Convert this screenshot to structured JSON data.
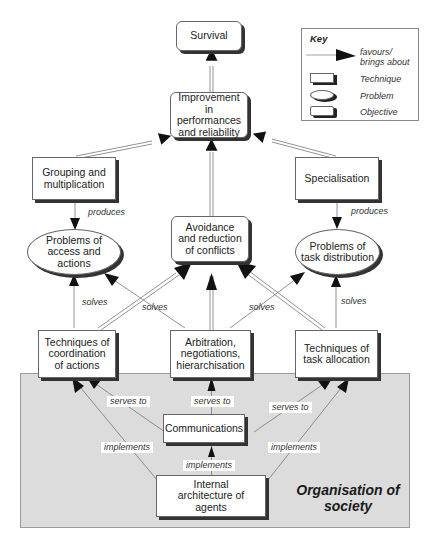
{
  "key": {
    "title": "Key",
    "items": [
      {
        "symbol": "arrow",
        "label": "favours/ brings about"
      },
      {
        "symbol": "rectangle",
        "label": "Technique"
      },
      {
        "symbol": "ellipse",
        "label": "Problem"
      },
      {
        "symbol": "rounded-rectangle",
        "label": "Objective"
      }
    ]
  },
  "nodes": {
    "survival": {
      "label": "Survival",
      "type": "Objective"
    },
    "improvement": {
      "label": "Improvement in performances and reliability",
      "type": "Objective"
    },
    "grouping": {
      "label": "Grouping and multiplication",
      "type": "Technique"
    },
    "specialisation": {
      "label": "Specialisation",
      "type": "Technique"
    },
    "avoidance": {
      "label": "Avoidance and reduction of conflicts",
      "type": "Objective"
    },
    "problems_access": {
      "label": "Problems of access and actions",
      "type": "Problem"
    },
    "problems_task": {
      "label": "Problems of task distribution",
      "type": "Problem"
    },
    "coordination": {
      "label": "Techniques of coordination of actions",
      "type": "Technique"
    },
    "arbitration": {
      "label": "Arbitration, negotiations, hierarchisation",
      "type": "Technique"
    },
    "task_allocation": {
      "label": "Techniques of task allocation",
      "type": "Technique"
    },
    "communications": {
      "label": "Communications",
      "type": "Technique"
    },
    "internal_architecture": {
      "label": "Internal architecture of agents",
      "type": "Technique"
    }
  },
  "edge_labels": {
    "produces_left": "produces",
    "produces_right": "produces",
    "solves_left": "solves",
    "solves_center_left": "solves",
    "solves_center_right": "solves",
    "solves_right": "solves",
    "serves_to_left": "serves to",
    "serves_to_center": "serves to",
    "serves_to_right": "serves to",
    "implements_left": "implements",
    "implements_center": "implements",
    "implements_right": "implements"
  },
  "region": {
    "title": "Organisation of society"
  },
  "colors": {
    "region_fill": "#dcdcdc",
    "arrow": "#111111",
    "line": "#777777"
  }
}
